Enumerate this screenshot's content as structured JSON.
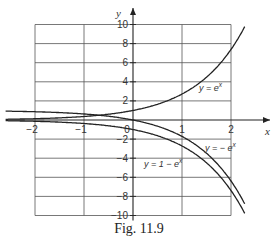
{
  "chart_data": {
    "type": "line",
    "title": "",
    "caption": "Fig. 11.9",
    "xlabel": "x",
    "ylabel": "y",
    "xlim": [
      -2,
      2
    ],
    "ylim": [
      -10,
      10
    ],
    "grid": true,
    "x_ticks": [
      -2,
      -1,
      0,
      1,
      2
    ],
    "x_tick_labels": [
      "-2",
      "-1",
      "0",
      "1",
      "2"
    ],
    "y_ticks": [
      -10,
      -8,
      -6,
      -4,
      -2,
      2,
      4,
      6,
      8,
      10
    ],
    "y_tick_labels": [
      "-10",
      "-8",
      "-6",
      "-4",
      "-2",
      "2",
      "4",
      "6",
      "8",
      "10"
    ],
    "series": [
      {
        "name": "y = e^x",
        "label": "y = e",
        "label_sup": "x",
        "x": [
          -2.2,
          -2,
          -1.5,
          -1,
          -0.5,
          0,
          0.5,
          1,
          1.5,
          2,
          2.2
        ],
        "y": [
          0.11,
          0.14,
          0.22,
          0.37,
          0.61,
          1,
          1.65,
          2.72,
          4.48,
          7.39,
          9.03
        ]
      },
      {
        "name": "y = -e^x",
        "label": "y = - e",
        "label_sup": "x",
        "x": [
          -2.2,
          -2,
          -1.5,
          -1,
          -0.5,
          0,
          0.5,
          1,
          1.5,
          2,
          2.2
        ],
        "y": [
          -0.11,
          -0.14,
          -0.22,
          -0.37,
          -0.61,
          -1,
          -1.65,
          -2.72,
          -4.48,
          -7.39,
          -9.03
        ]
      },
      {
        "name": "y = 1 - e^x",
        "label": "y = 1 - e",
        "label_sup": "x",
        "x": [
          -2.2,
          -2,
          -1.5,
          -1,
          -0.5,
          0,
          0.5,
          1,
          1.5,
          2,
          2.2
        ],
        "y": [
          0.89,
          0.86,
          0.78,
          0.63,
          0.39,
          0,
          -0.65,
          -1.72,
          -3.48,
          -6.39,
          -8.03
        ]
      }
    ],
    "annotations": [
      {
        "text": "y = e^x",
        "near": [
          1.6,
          4
        ]
      },
      {
        "text": "y = 1 - e^x",
        "near": [
          1.7,
          -2
        ]
      },
      {
        "text": "y = -e^x",
        "near": [
          0.5,
          -4.2
        ]
      }
    ]
  }
}
